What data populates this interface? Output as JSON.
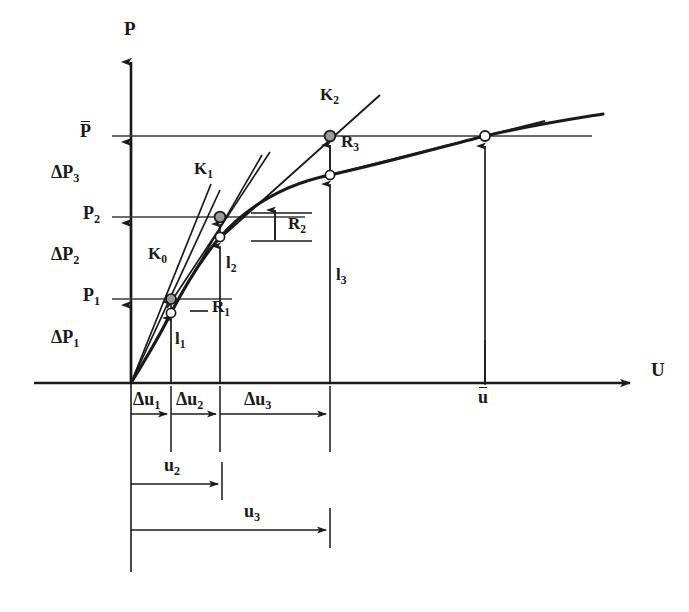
{
  "figure": {
    "axes": {
      "y_label": "P",
      "x_label": "U",
      "origin": {
        "x": 131,
        "y": 383
      },
      "x_axis_end": 640,
      "y_axis_top": 52
    },
    "colors": {
      "line": "#1a1a1a",
      "curve": "#1a1a1a",
      "thin": "#3a3a3a",
      "marker_fill_solid": "#9a9a9a",
      "marker_fill_open": "#ffffff",
      "background": "#ffffff"
    }
  },
  "load_levels": [
    {
      "name": "P_bar",
      "label_text": "P",
      "overline": true,
      "subscript": "",
      "y": 136,
      "line_from_x": 131,
      "line_to_x": 592
    },
    {
      "name": "P2",
      "label_text": "P",
      "overline": false,
      "subscript": "2",
      "y": 217,
      "line_from_x": 131,
      "line_to_x": 305
    },
    {
      "name": "P1",
      "label_text": "P",
      "overline": false,
      "subscript": "1",
      "y": 299,
      "line_from_x": 112,
      "line_to_x": 232
    }
  ],
  "load_increments": [
    {
      "name": "dP3",
      "label_text": "ΔP",
      "subscript": "3",
      "x_arrow": 131,
      "from_y": 217,
      "to_y": 136,
      "label_x": 55,
      "label_y": 165
    },
    {
      "name": "dP2",
      "label_text": "ΔP",
      "subscript": "2",
      "x_arrow": 131,
      "from_y": 299,
      "to_y": 217,
      "label_x": 55,
      "label_y": 247
    },
    {
      "name": "dP1",
      "label_text": "ΔP",
      "subscript": "1",
      "x_arrow": 131,
      "from_y": 383,
      "to_y": 299,
      "label_x": 55,
      "label_y": 330
    }
  ],
  "axis_labels": [
    {
      "name": "y-axis-label",
      "text": "P",
      "x": 126,
      "y": 22
    },
    {
      "name": "x-axis-label",
      "text": "U",
      "x": 651,
      "y": 364
    }
  ],
  "level_label_positions": [
    {
      "name": "p-bar-label",
      "x": 85,
      "y": 124
    },
    {
      "name": "p2-label",
      "x": 85,
      "y": 206
    },
    {
      "name": "p1-label",
      "x": 85,
      "y": 288
    }
  ],
  "stiffness_labels": [
    {
      "name": "K0",
      "label_text": "K",
      "subscript": "0",
      "x": 150,
      "y": 247
    },
    {
      "name": "K1",
      "label_text": "K",
      "subscript": "1",
      "x": 196,
      "y": 162
    },
    {
      "name": "K2",
      "label_text": "K",
      "subscript": "2",
      "x": 322,
      "y": 89
    }
  ],
  "residual_labels": [
    {
      "name": "R1",
      "label_text": "R",
      "subscript": "1",
      "x": 213,
      "y": 300
    },
    {
      "name": "R2",
      "label_text": "R",
      "subscript": "2",
      "x": 292,
      "y": 224
    },
    {
      "name": "R3",
      "label_text": "R",
      "subscript": "3",
      "x": 343,
      "y": 140
    }
  ],
  "internal_force_labels": [
    {
      "name": "l1",
      "label_text": "l",
      "subscript": "1",
      "x": 176,
      "y": 332
    },
    {
      "name": "l2",
      "label_text": "l",
      "subscript": "2",
      "x": 227,
      "y": 256
    },
    {
      "name": "l3",
      "label_text": "l",
      "subscript": "3",
      "x": 337,
      "y": 268
    }
  ],
  "internal_force_arrows": [
    {
      "name": "l1-arrow",
      "x": 171,
      "from_y": 383,
      "to_y": 310
    },
    {
      "name": "l2-arrow",
      "x": 220,
      "from_y": 383,
      "to_y": 225
    },
    {
      "name": "l3-arrow",
      "x": 330,
      "from_y": 383,
      "to_y": 180
    },
    {
      "name": "u-bar-arrow",
      "x": 485,
      "from_y": 383,
      "to_y": 142
    }
  ],
  "residual_arrows": [
    {
      "name": "R1-arrow",
      "x": 171,
      "from_y": 310,
      "to_y": 296,
      "bracket": false
    },
    {
      "name": "R2-arrow",
      "x": 275,
      "from_y": 238,
      "to_y": 208,
      "bracket": true,
      "bracket_from_x": 251,
      "bracket_to_x": 305
    },
    {
      "name": "R3-arrow",
      "x": 330,
      "from_y": 180,
      "to_y": 141,
      "bracket": false
    },
    {
      "name": "R2b-arrow",
      "x": 220,
      "from_y": 248,
      "to_y": 224,
      "bracket": false
    }
  ],
  "displacement_increments": [
    {
      "name": "du1",
      "label_text": "Δu",
      "subscript": "1",
      "from_x": 131,
      "to_x": 171,
      "y": 414,
      "label_x": 134,
      "label_y": 392
    },
    {
      "name": "du2",
      "label_text": "Δu",
      "subscript": "2",
      "from_x": 171,
      "to_x": 220,
      "y": 414,
      "label_x": 176,
      "label_y": 392
    },
    {
      "name": "du3",
      "label_text": "Δu",
      "subscript": "3",
      "from_x": 220,
      "to_x": 330,
      "y": 414,
      "label_x": 246,
      "label_y": 392
    }
  ],
  "total_displacements": [
    {
      "name": "u2",
      "label_text": "u",
      "subscript": "2",
      "from_x": 131,
      "to_x": 222,
      "y": 484,
      "label_x": 166,
      "label_y": 458
    },
    {
      "name": "u3",
      "label_text": "u",
      "subscript": "3",
      "from_x": 131,
      "to_x": 330,
      "y": 530,
      "label_x": 246,
      "label_y": 504
    }
  ],
  "displacement_ticks": [
    {
      "name": "tick-du1",
      "x": 171,
      "from_y": 388,
      "to_y": 452
    },
    {
      "name": "tick-du2",
      "x": 220,
      "from_y": 388,
      "to_y": 452
    },
    {
      "name": "tick-du3",
      "x": 330,
      "from_y": 388,
      "to_y": 452
    },
    {
      "name": "tick-u2",
      "x": 222,
      "from_y": 462,
      "to_y": 500
    },
    {
      "name": "tick-u3",
      "x": 330,
      "from_y": 506,
      "to_y": 548
    },
    {
      "name": "tick-u-bar-axis",
      "x": 485,
      "from_y": 340,
      "to_y": 386
    },
    {
      "name": "tick-origin-down",
      "x": 131,
      "from_y": 383,
      "to_y": 572
    }
  ],
  "u_bar_label": {
    "name": "u-bar-label",
    "text": "u",
    "x": 479,
    "y": 390
  },
  "markers": [
    {
      "name": "marker-p1-tangent",
      "x": 171,
      "y": 299,
      "style": "solid"
    },
    {
      "name": "marker-p1-curve",
      "x": 171,
      "y": 313,
      "style": "open"
    },
    {
      "name": "marker-p2-tangent",
      "x": 220,
      "y": 217,
      "style": "solid"
    },
    {
      "name": "marker-p2-curve",
      "x": 220,
      "y": 237,
      "style": "open"
    },
    {
      "name": "marker-p3-tangent",
      "x": 330,
      "y": 136,
      "style": "solid"
    },
    {
      "name": "marker-p3-curve",
      "x": 330,
      "y": 175,
      "style": "open"
    },
    {
      "name": "marker-converged",
      "x": 485,
      "y": 136,
      "style": "open"
    }
  ],
  "curve": {
    "name": "load-displacement-curve",
    "description": "Nonlinear structural response curve",
    "path": "M 131 383 C 150 350, 163 330, 171 313 C 185 285, 205 255, 220 237 C 255 198, 295 182, 330 175 C 385 163, 440 147, 485 136 C 530 126, 570 120, 600 115"
  },
  "tangents": [
    {
      "name": "tangent-K0-a",
      "x1": 131,
      "y1": 383,
      "x2": 211,
      "y2": 184
    },
    {
      "name": "tangent-K0-b",
      "x1": 131,
      "y1": 383,
      "x2": 219,
      "y2": 188
    },
    {
      "name": "tangent-K1",
      "x1": 171,
      "y1": 313,
      "x2": 262,
      "y2": 155
    },
    {
      "name": "tangent-K1b",
      "x1": 171,
      "y1": 299,
      "x2": 268,
      "y2": 154
    },
    {
      "name": "tangent-K2",
      "x1": 220,
      "y1": 237,
      "x2": 378,
      "y2": 96
    },
    {
      "name": "tangent-K3",
      "x1": 330,
      "y1": 175,
      "x2": 540,
      "y2": 122
    }
  ]
}
